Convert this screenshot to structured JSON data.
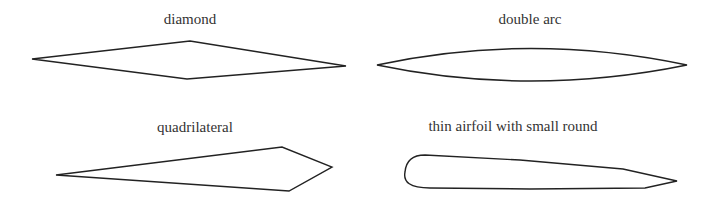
{
  "figure": {
    "panels": [
      {
        "id": "diamond",
        "label": "diamond"
      },
      {
        "id": "double-arc",
        "label": "double arc"
      },
      {
        "id": "quadrilateral",
        "label": "quadrilateral"
      },
      {
        "id": "thin-airfoil",
        "label": "thin airfoil with small round"
      }
    ],
    "colors": {
      "stroke": "#222222",
      "text": "#333333",
      "background": "#ffffff"
    }
  }
}
